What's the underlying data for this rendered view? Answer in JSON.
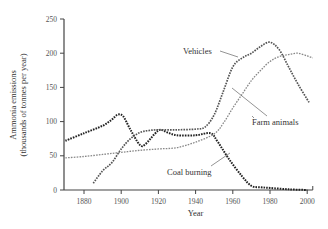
{
  "chart_data": {
    "type": "line",
    "title": "",
    "xlabel": "Year",
    "ylabel": "Ammonia emissions (thousands of tonnes per year)",
    "ylabel_lines": [
      "Ammonia emissions",
      "(thousands of tonnes per year)"
    ],
    "xlim": [
      1865,
      2005
    ],
    "ylim": [
      0,
      250
    ],
    "xticks": [
      1880,
      1900,
      1920,
      1940,
      1960,
      1980,
      2000
    ],
    "yticks": [
      0,
      50,
      100,
      150,
      200,
      250
    ],
    "grid": false,
    "legend": "inline annotations",
    "series": [
      {
        "name": "Coal burning",
        "color": "#222222",
        "points": [
          [
            1870,
            72
          ],
          [
            1880,
            83
          ],
          [
            1890,
            94
          ],
          [
            1895,
            103
          ],
          [
            1898,
            110
          ],
          [
            1901,
            108
          ],
          [
            1905,
            88
          ],
          [
            1910,
            66
          ],
          [
            1913,
            67
          ],
          [
            1918,
            82
          ],
          [
            1921,
            88
          ],
          [
            1925,
            84
          ],
          [
            1930,
            80
          ],
          [
            1940,
            80
          ],
          [
            1948,
            83
          ],
          [
            1952,
            70
          ],
          [
            1958,
            45
          ],
          [
            1965,
            20
          ],
          [
            1970,
            6
          ],
          [
            1975,
            4
          ],
          [
            1980,
            3
          ],
          [
            1990,
            1
          ],
          [
            2000,
            0
          ]
        ]
      },
      {
        "name": "Vehicles",
        "color": "#555555",
        "points": [
          [
            1885,
            10
          ],
          [
            1890,
            28
          ],
          [
            1895,
            40
          ],
          [
            1900,
            60
          ],
          [
            1905,
            75
          ],
          [
            1910,
            84
          ],
          [
            1915,
            87
          ],
          [
            1920,
            88
          ],
          [
            1930,
            88
          ],
          [
            1940,
            89
          ],
          [
            1945,
            92
          ],
          [
            1950,
            110
          ],
          [
            1955,
            145
          ],
          [
            1960,
            180
          ],
          [
            1965,
            193
          ],
          [
            1970,
            200
          ],
          [
            1975,
            210
          ],
          [
            1980,
            216
          ],
          [
            1985,
            205
          ],
          [
            1990,
            180
          ],
          [
            1995,
            155
          ],
          [
            2001,
            128
          ]
        ]
      },
      {
        "name": "Farm animals",
        "color": "#888888",
        "points": [
          [
            1870,
            47
          ],
          [
            1880,
            49
          ],
          [
            1890,
            52
          ],
          [
            1900,
            55
          ],
          [
            1910,
            58
          ],
          [
            1920,
            60
          ],
          [
            1930,
            62
          ],
          [
            1940,
            70
          ],
          [
            1950,
            82
          ],
          [
            1955,
            98
          ],
          [
            1960,
            120
          ],
          [
            1965,
            140
          ],
          [
            1970,
            160
          ],
          [
            1975,
            175
          ],
          [
            1980,
            188
          ],
          [
            1985,
            195
          ],
          [
            1990,
            198
          ],
          [
            1995,
            200
          ],
          [
            2000,
            196
          ],
          [
            2003,
            193
          ]
        ]
      }
    ],
    "annotations": [
      {
        "text": "Vehicles",
        "x": 1953,
        "y": 190
      },
      {
        "text": "Farm animals",
        "x": 1968,
        "y": 75
      },
      {
        "text": "Coal burning",
        "x": 1925,
        "y": 25
      }
    ]
  }
}
